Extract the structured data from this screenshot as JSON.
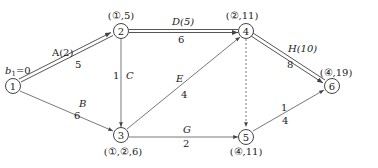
{
  "diagram": {
    "type": "network-critical-path",
    "start_label": {
      "b": "b",
      "sub": "1",
      "rest": "=0"
    },
    "nodes": [
      {
        "id": "1",
        "x": 13,
        "y": 86,
        "label": "1",
        "annotation": ""
      },
      {
        "id": "2",
        "x": 121,
        "y": 31,
        "label": "2",
        "annotation": "(①,5)"
      },
      {
        "id": "3",
        "x": 121,
        "y": 135,
        "label": "3",
        "annotation": "(①,②,6)"
      },
      {
        "id": "4",
        "x": 246,
        "y": 31,
        "label": "4",
        "annotation": "(②,11)"
      },
      {
        "id": "5",
        "x": 246,
        "y": 135,
        "label": "5",
        "annotation": "(④,11)"
      },
      {
        "id": "6",
        "x": 332,
        "y": 86,
        "label": "6",
        "annotation": "(④,19)"
      }
    ],
    "edges": [
      {
        "from": "1",
        "to": "2",
        "name": "A(2)",
        "weight": "5",
        "critical": true,
        "dashed": false
      },
      {
        "from": "1",
        "to": "3",
        "name": "B",
        "weight": "6",
        "critical": false,
        "dashed": false
      },
      {
        "from": "2",
        "to": "3",
        "name": "C",
        "weight": "1",
        "critical": false,
        "dashed": false
      },
      {
        "from": "2",
        "to": "4",
        "name": "D(5)",
        "weight": "6",
        "critical": true,
        "dashed": false
      },
      {
        "from": "3",
        "to": "4",
        "name": "E",
        "weight": "4",
        "critical": false,
        "dashed": false
      },
      {
        "from": "3",
        "to": "5",
        "name": "G",
        "weight": "2",
        "critical": false,
        "dashed": false
      },
      {
        "from": "4",
        "to": "5",
        "name": "",
        "weight": "",
        "critical": false,
        "dashed": true
      },
      {
        "from": "4",
        "to": "6",
        "name": "H(10)",
        "weight": "8",
        "critical": true,
        "dashed": false
      },
      {
        "from": "5",
        "to": "6",
        "name": "1",
        "weight": "4",
        "critical": false,
        "dashed": false
      }
    ]
  },
  "colors": {
    "line": "#555555",
    "text": "#222222",
    "background": "#ffffff"
  }
}
